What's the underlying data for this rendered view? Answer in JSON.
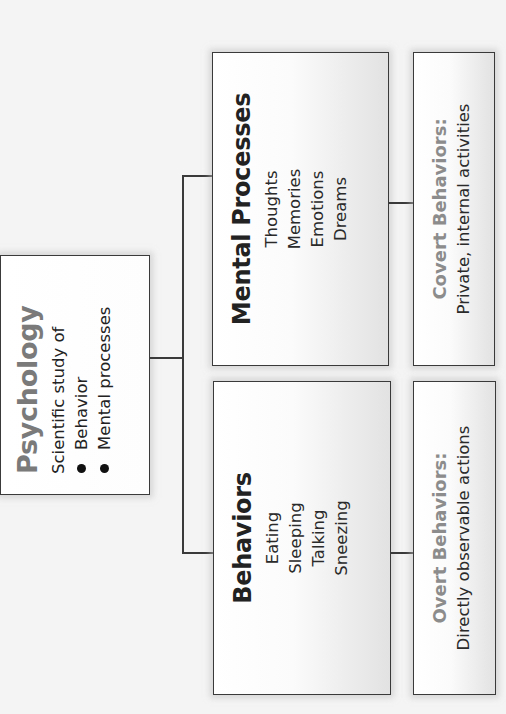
{
  "diagram": {
    "type": "hierarchy",
    "orientation": "rotated-90-ccw",
    "root": {
      "title": "Psychology",
      "description": "Scientific study of",
      "bullets": [
        "Behavior",
        "Mental processes"
      ]
    },
    "branches": [
      {
        "title": "Behaviors",
        "items": [
          "Eating",
          "Sleeping",
          "Talking",
          "Sneezing"
        ],
        "sub": {
          "title": "Overt Behaviors:",
          "description": "Directly observable actions"
        }
      },
      {
        "title": "Mental Processes",
        "items": [
          "Thoughts",
          "Memories",
          "Emotions",
          "Dreams"
        ],
        "sub": {
          "title": "Covert Behaviors:",
          "description": "Private, internal activities"
        }
      }
    ]
  },
  "colors": {
    "root_title": "#7a7a7a",
    "sub_title": "#8c8c8c",
    "border": "#3a3a3a",
    "text": "#222222"
  }
}
